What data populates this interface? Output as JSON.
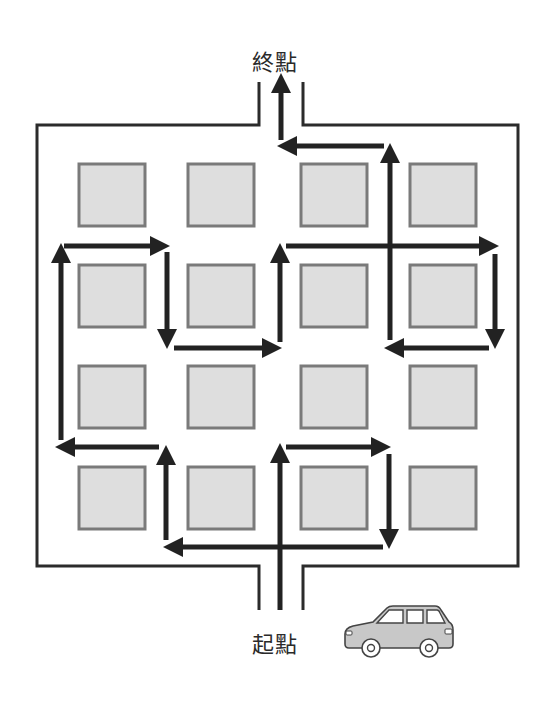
{
  "labels": {
    "end": "終點",
    "start": "起點"
  },
  "colors": {
    "wall": "#2b2b2b",
    "arrow": "#222222",
    "block_fill": "#dedede",
    "block_stroke": "#7a7a7a",
    "car_body": "#c8c8c8",
    "car_stroke": "#444444",
    "background": "#ffffff"
  },
  "walls": {
    "outer": {
      "left": 37,
      "top": 125,
      "right": 518,
      "bottom": 566
    },
    "top_opening": {
      "left_x": 259,
      "right_x": 303,
      "top_y": 82
    },
    "bottom_opening": {
      "left_x": 259,
      "right_x": 303,
      "bottom_y": 610
    }
  },
  "blocks": {
    "cols": [
      79,
      188,
      301,
      410
    ],
    "rows": [
      164,
      265,
      366,
      467
    ],
    "width": 66,
    "height": 62
  },
  "arrows": [
    {
      "id": "exit-up",
      "x1": 281,
      "y1": 140,
      "x2": 281,
      "y2": 82
    },
    {
      "id": "top-left",
      "x1": 384,
      "y1": 146,
      "x2": 286,
      "y2": 146
    },
    {
      "id": "col4-up-top",
      "x1": 390,
      "y1": 340,
      "x2": 390,
      "y2": 152
    },
    {
      "id": "row2-right-long",
      "x1": 286,
      "y1": 246,
      "x2": 490,
      "y2": 246
    },
    {
      "id": "right-down",
      "x1": 495,
      "y1": 254,
      "x2": 495,
      "y2": 340
    },
    {
      "id": "right-left",
      "x1": 489,
      "y1": 348,
      "x2": 393,
      "y2": 348
    },
    {
      "id": "col3-up-mid",
      "x1": 280,
      "y1": 342,
      "x2": 280,
      "y2": 252
    },
    {
      "id": "mid-right",
      "x1": 174,
      "y1": 348,
      "x2": 273,
      "y2": 348
    },
    {
      "id": "col2-down",
      "x1": 167,
      "y1": 252,
      "x2": 167,
      "y2": 340
    },
    {
      "id": "row2-right-short",
      "x1": 64,
      "y1": 246,
      "x2": 161,
      "y2": 246
    },
    {
      "id": "left-up",
      "x1": 61,
      "y1": 440,
      "x2": 61,
      "y2": 252
    },
    {
      "id": "lower-left",
      "x1": 159,
      "y1": 447,
      "x2": 64,
      "y2": 447
    },
    {
      "id": "col2-up-low",
      "x1": 166,
      "y1": 540,
      "x2": 166,
      "y2": 454
    },
    {
      "id": "bottom-left",
      "x1": 383,
      "y1": 547,
      "x2": 172,
      "y2": 547
    },
    {
      "id": "entry-up",
      "x1": 280,
      "y1": 610,
      "x2": 280,
      "y2": 452
    },
    {
      "id": "lower-right",
      "x1": 286,
      "y1": 447,
      "x2": 382,
      "y2": 447
    },
    {
      "id": "col4-down-low",
      "x1": 389,
      "y1": 454,
      "x2": 389,
      "y2": 540
    }
  ],
  "car": {
    "x": 343,
    "y": 604,
    "width": 112,
    "height": 56
  }
}
